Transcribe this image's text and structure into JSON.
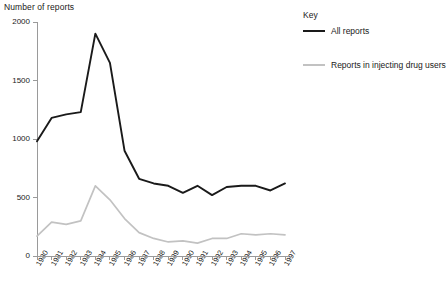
{
  "legend": {
    "title": "Key",
    "entries": [
      {
        "label": "All reports",
        "color": "#1a1a1a"
      },
      {
        "label": "Reports in injecting drug users",
        "color": "#c2c2c2"
      }
    ]
  },
  "chart_data": {
    "type": "line",
    "title": "",
    "xlabel": "",
    "ylabel": "Number of reports",
    "ylim": [
      0,
      2000
    ],
    "yticks": [
      0,
      500,
      1000,
      1500,
      2000
    ],
    "grid": false,
    "legend_position": "right",
    "categories": [
      "1980",
      "1981",
      "1982",
      "1983",
      "1984",
      "1985",
      "1986",
      "1987",
      "1988",
      "1989",
      "1990",
      "1991",
      "1992",
      "1993",
      "1994",
      "1995",
      "1996",
      "1997"
    ],
    "series": [
      {
        "name": "All reports",
        "color": "#1a1a1a",
        "values": [
          980,
          1180,
          1210,
          1230,
          1900,
          1650,
          900,
          660,
          620,
          600,
          540,
          600,
          520,
          590,
          600,
          600,
          560,
          620
        ]
      },
      {
        "name": "Reports in injecting drug users",
        "color": "#c2c2c2",
        "values": [
          170,
          290,
          270,
          300,
          600,
          480,
          320,
          200,
          150,
          120,
          130,
          110,
          150,
          150,
          190,
          180,
          190,
          180
        ]
      }
    ]
  }
}
